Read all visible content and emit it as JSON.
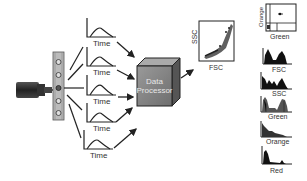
{
  "diagram": {
    "detector_pulses": [
      {
        "label": "Time"
      },
      {
        "label": "Time"
      },
      {
        "label": "Time"
      },
      {
        "label": "Time"
      },
      {
        "label": "Time"
      }
    ],
    "processor": {
      "line1": "Data",
      "line2": "Processor"
    },
    "scatter_plot": {
      "ylabel": "SSC",
      "xlabel": "FSC"
    },
    "quadrant_plot": {
      "ylabel": "Orange",
      "xlabel": "Green"
    },
    "histograms": [
      {
        "label": "FSC"
      },
      {
        "label": "SSC"
      },
      {
        "label": "Green"
      },
      {
        "label": "Orange"
      },
      {
        "label": "Red"
      }
    ]
  }
}
